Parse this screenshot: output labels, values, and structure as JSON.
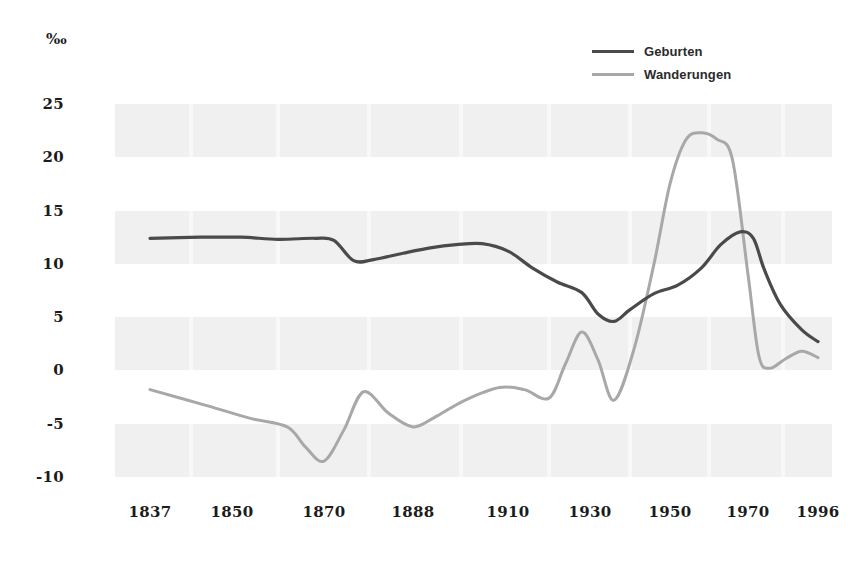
{
  "chart_data": {
    "type": "line",
    "title": "",
    "subtitle": "",
    "xlabel": "",
    "ylabel": "",
    "unit_label": "‰",
    "grid": "horizontal-bands",
    "legend_position": "top-right",
    "xlim": [
      1837,
      1996
    ],
    "ylim": [
      -11,
      27
    ],
    "yticks": [
      25,
      20,
      15,
      10,
      5,
      0,
      -5,
      -10
    ],
    "ytick_labels": [
      "25",
      "20",
      "15",
      "10",
      "5",
      "0",
      "-5",
      "-10"
    ],
    "xticks": [
      1837,
      1850,
      1870,
      1888,
      1910,
      1930,
      1950,
      1970,
      1996
    ],
    "xtick_labels": [
      "1837",
      "1850",
      "1870",
      "1888",
      "1910",
      "1930",
      "1950",
      "1970",
      "1996"
    ],
    "series": [
      {
        "name": "Geburten",
        "color": "#4a4a4a",
        "x": [
          1837,
          1845,
          1852,
          1860,
          1868,
          1872,
          1876,
          1880,
          1886,
          1892,
          1898,
          1904,
          1910,
          1916,
          1922,
          1928,
          1932,
          1936,
          1940,
          1946,
          1952,
          1958,
          1963,
          1968,
          1972,
          1976,
          1982,
          1990,
          1996
        ],
        "values": [
          12.4,
          12.5,
          12.5,
          12.3,
          12.4,
          12.2,
          10.3,
          10.4,
          11.0,
          11.5,
          11.8,
          11.9,
          11.2,
          9.6,
          8.3,
          7.3,
          5.3,
          4.6,
          5.7,
          7.2,
          8.0,
          9.6,
          11.8,
          13.0,
          12.4,
          9.5,
          6.2,
          3.8,
          2.7
        ]
      },
      {
        "name": "Wanderungen",
        "color": "#a8a8a8",
        "x": [
          1837,
          1846,
          1854,
          1862,
          1866,
          1870,
          1874,
          1878,
          1883,
          1888,
          1893,
          1900,
          1908,
          1914,
          1920,
          1924,
          1928,
          1932,
          1936,
          1941,
          1946,
          1950,
          1954,
          1958,
          1962,
          1966,
          1970,
          1974,
          1978,
          1984,
          1990,
          1996
        ],
        "values": [
          -1.8,
          -3.3,
          -4.5,
          -5.3,
          -7.2,
          -8.5,
          -5.6,
          -2.0,
          -4.0,
          -5.3,
          -4.4,
          -2.8,
          -1.6,
          -1.8,
          -2.6,
          0.6,
          3.6,
          1.0,
          -2.8,
          2.0,
          10.0,
          17.5,
          21.6,
          22.3,
          21.7,
          19.8,
          9.0,
          1.4,
          0.2,
          1.1,
          1.8,
          1.2
        ]
      }
    ],
    "annotations": []
  },
  "legend": {
    "items": [
      {
        "label": "Geburten",
        "color": "#4a4a4a"
      },
      {
        "label": "Wanderungen",
        "color": "#a8a8a8"
      }
    ]
  },
  "colors": {
    "band": "#f0f0f0",
    "text": "#1c1c1c",
    "background": "#ffffff"
  }
}
